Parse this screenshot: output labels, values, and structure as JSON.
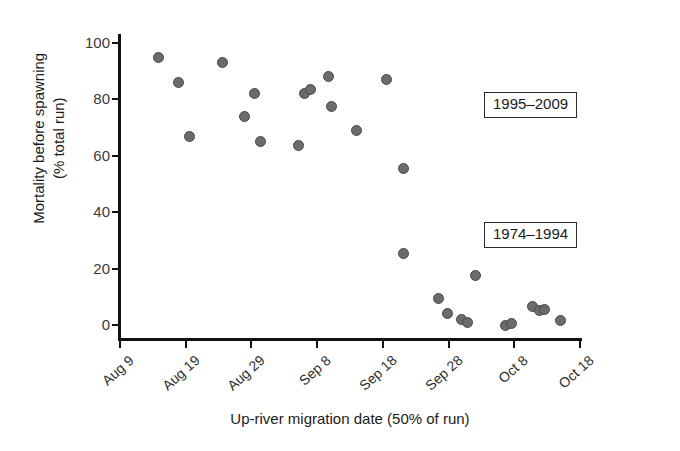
{
  "chart_data": {
    "type": "scatter",
    "title": "",
    "xlabel": "Up-river migration date (50% of run)",
    "ylabel": "Mortality before spawning (% total run)",
    "ylim": [
      0,
      104
    ],
    "yticks": [
      0,
      20,
      40,
      60,
      80,
      100
    ],
    "ytick_labels": [
      "0",
      "20",
      "40",
      "60",
      "80",
      "100"
    ],
    "xticks": [
      "Aug 9",
      "Aug 19",
      "Aug 29",
      "Sep 8",
      "Sep 18",
      "Sep 28",
      "Oct 8",
      "Oct 18"
    ],
    "xtick_days": [
      0,
      10,
      20,
      30,
      40,
      50,
      60,
      70
    ],
    "xlim_days": [
      0,
      70
    ],
    "grid": false,
    "legend": "none",
    "marker_color": "#6b6b6b",
    "marker_edge_color": "#4a4a4a",
    "annotations": [
      {
        "text": "1995–2009",
        "x_day": 56,
        "y": 86
      },
      {
        "text": "1974–1994",
        "x_day": 56,
        "y": 44
      }
    ],
    "points": [
      {
        "x_day": 5.8,
        "y": 95.0
      },
      {
        "x_day": 8.9,
        "y": 86.0
      },
      {
        "x_day": 10.6,
        "y": 67.0
      },
      {
        "x_day": 15.6,
        "y": 93.0
      },
      {
        "x_day": 18.9,
        "y": 74.0
      },
      {
        "x_day": 20.4,
        "y": 82.0
      },
      {
        "x_day": 21.4,
        "y": 65.0
      },
      {
        "x_day": 27.2,
        "y": 63.5
      },
      {
        "x_day": 28.0,
        "y": 82.0
      },
      {
        "x_day": 29.0,
        "y": 83.5
      },
      {
        "x_day": 31.7,
        "y": 88.0
      },
      {
        "x_day": 32.2,
        "y": 77.5
      },
      {
        "x_day": 36.0,
        "y": 69.0
      },
      {
        "x_day": 40.5,
        "y": 87.0
      },
      {
        "x_day": 43.2,
        "y": 55.5
      },
      {
        "x_day": 43.2,
        "y": 25.5
      },
      {
        "x_day": 48.5,
        "y": 9.5
      },
      {
        "x_day": 49.9,
        "y": 4.0
      },
      {
        "x_day": 51.9,
        "y": 2.0
      },
      {
        "x_day": 52.9,
        "y": 1.0
      },
      {
        "x_day": 54.1,
        "y": 17.5
      },
      {
        "x_day": 58.6,
        "y": 0.0
      },
      {
        "x_day": 59.6,
        "y": 0.5
      },
      {
        "x_day": 62.8,
        "y": 6.5
      },
      {
        "x_day": 63.9,
        "y": 5.0
      },
      {
        "x_day": 64.6,
        "y": 5.5
      },
      {
        "x_day": 67.0,
        "y": 1.5
      }
    ]
  },
  "axis": {
    "y_title": "Mortality before spawning",
    "y_title_line2": "(% total run)",
    "x_title": "Up-river migration date (50% of run)"
  }
}
